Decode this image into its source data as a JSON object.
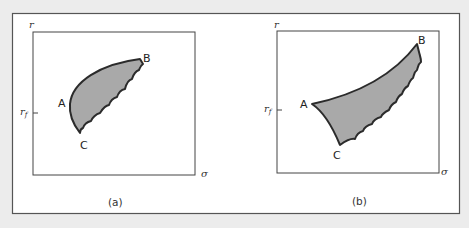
{
  "panels": [
    {
      "id": "a",
      "caption": "(a)",
      "y_axis_label": "r",
      "x_axis_label": "σ",
      "rf_label": "r",
      "rf_sub": "f",
      "points": {
        "A": "A",
        "B": "B",
        "C": "C"
      }
    },
    {
      "id": "b",
      "caption": "(b)",
      "y_axis_label": "r",
      "x_axis_label": "σ",
      "rf_label": "r",
      "rf_sub": "f",
      "points": {
        "A": "A",
        "B": "B",
        "C": "C"
      }
    }
  ],
  "colors": {
    "background": "#ececec",
    "frame_fill": "#ffffff",
    "region_fill": "#a9a9a9",
    "outline": "#2b2b2b"
  }
}
